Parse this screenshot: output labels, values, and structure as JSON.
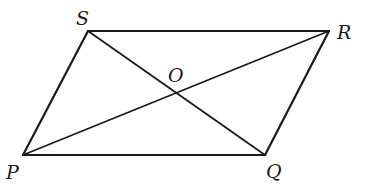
{
  "figure": {
    "shape": "parallelogram",
    "name": "PQRS",
    "vertices": {
      "S": {
        "label": "S",
        "x": 88,
        "y": 31,
        "label_x": 76,
        "label_y": 25
      },
      "R": {
        "label": "R",
        "x": 329,
        "y": 31,
        "label_x": 337,
        "label_y": 39
      },
      "Q": {
        "label": "Q",
        "x": 265,
        "y": 155,
        "label_x": 266,
        "label_y": 178
      },
      "P": {
        "label": "P",
        "x": 23,
        "y": 155,
        "label_x": 6,
        "label_y": 179
      }
    },
    "intersection": {
      "label": "O",
      "x": 177,
      "y": 93,
      "label_x": 168,
      "label_y": 82
    },
    "sides": [
      "PQ",
      "QR",
      "RS",
      "SP"
    ],
    "diagonals": [
      "PR",
      "SQ"
    ],
    "stroke_color": "#1a1a1a"
  }
}
